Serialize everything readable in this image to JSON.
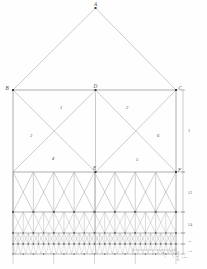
{
  "diagram": {
    "stroke_color": "#9a9a9a",
    "stroke_color_dark": "#6e6e6e",
    "node_color": "#3a3a3a",
    "background": "#fefefe"
  },
  "vertices": [
    {
      "id": "A",
      "label": "A",
      "x": 95.5,
      "y": 8.0,
      "lx": 94.0,
      "ly": 2.0
    },
    {
      "id": "B",
      "label": "B",
      "x": 13.0,
      "y": 90.0,
      "lx": 5.5,
      "ly": 85.5
    },
    {
      "id": "D",
      "label": "D",
      "x": 95.5,
      "y": 90.0,
      "lx": 93.5,
      "ly": 84.0
    },
    {
      "id": "C",
      "label": "C",
      "x": 176.0,
      "y": 90.0,
      "lx": 178.5,
      "ly": 85.5
    },
    {
      "id": "E",
      "label": "E",
      "x": 95.5,
      "y": 172.0,
      "lx": 93.0,
      "ly": 165.5
    },
    {
      "id": "F",
      "label": "F",
      "x": 176.0,
      "y": 172.0,
      "lx": 178.0,
      "ly": 167.5
    }
  ],
  "panels": [
    {
      "label": "1",
      "x": 60.0,
      "y": 106.0
    },
    {
      "label": "2",
      "x": 126.0,
      "y": 106.0
    },
    {
      "label": "3",
      "x": 30.0,
      "y": 134.0
    },
    {
      "label": "4",
      "x": 52.0,
      "y": 157.0
    },
    {
      "label": "5",
      "x": 136.0,
      "y": 158.0
    },
    {
      "label": "6",
      "x": 157.0,
      "y": 134.0
    }
  ],
  "dimensions": [
    {
      "label": "1",
      "x": 188.0,
      "y": 129.0,
      "size": "dim-lbl",
      "from_y": 90.0,
      "to_y": 172.0
    },
    {
      "label": "1/2",
      "x": 188.0,
      "y": 192.0,
      "size": "dim-lbl-sm",
      "from_y": 172.0,
      "to_y": 212.0
    },
    {
      "label": "1/4",
      "x": 188.0,
      "y": 224.0,
      "size": "dim-lbl-sm",
      "from_y": 212.0,
      "to_y": 233.0
    },
    {
      "label": "1/8",
      "x": 188.0,
      "y": 240.5,
      "size": "dim-lbl-xs",
      "from_y": 233.0,
      "to_y": 244.0
    },
    {
      "label": "1/16",
      "x": 188.0,
      "y": 250.5,
      "size": "dim-lbl-xs",
      "from_y": 244.0,
      "to_y": 254.0
    }
  ],
  "detail_labels": [
    {
      "label": "a",
      "x": 152.0,
      "y": 253.5
    },
    {
      "label": "b",
      "x": 163.0,
      "y": 252.0
    },
    {
      "label": "c",
      "x": 171.0,
      "y": 250.5
    },
    {
      "label": "d",
      "x": 176.5,
      "y": 255.5
    },
    {
      "label": "1/32",
      "x": 182.0,
      "y": 257.0
    }
  ],
  "base": {
    "left_x": 13.0,
    "right_x": 176.0,
    "top_y": 90.0,
    "bottom_y": 254.0
  },
  "levels": {
    "y_ridge": 8.0,
    "y_tie": 90.0,
    "y_mid": 172.0,
    "y_l2": 212.0,
    "y_l3": 233.0,
    "y_l4": 244.0,
    "y_base": 254.0
  }
}
